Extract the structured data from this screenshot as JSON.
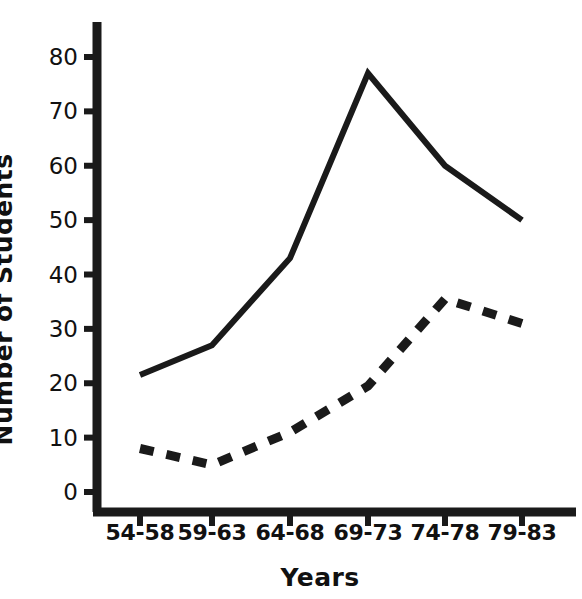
{
  "chart_data": {
    "type": "line",
    "title": "",
    "xlabel": "Years",
    "ylabel": "Number of Students",
    "categories": [
      "54-58",
      "59-63",
      "64-68",
      "69-73",
      "74-78",
      "79-83"
    ],
    "ylim": [
      0,
      85
    ],
    "yticks": [
      0,
      10,
      20,
      30,
      40,
      50,
      60,
      70,
      80
    ],
    "ytick_labels": [
      "0",
      "10",
      "20",
      "30",
      "40",
      "50",
      "60",
      "70",
      "80"
    ],
    "grid": false,
    "legend": "none",
    "series": [
      {
        "name": "solid-series",
        "style": "solid",
        "color": "#1a1a1a",
        "values": [
          21.5,
          27,
          43,
          77,
          60,
          50
        ]
      },
      {
        "name": "dashed-series",
        "style": "dashed",
        "color": "#1a1a1a",
        "values": [
          8,
          5,
          11,
          19.5,
          35.5,
          31
        ]
      }
    ]
  },
  "axes": {
    "y_title": "Number of Students",
    "x_title": "Years"
  },
  "colors": {
    "ink": "#1a1a1a",
    "background": "#ffffff"
  }
}
